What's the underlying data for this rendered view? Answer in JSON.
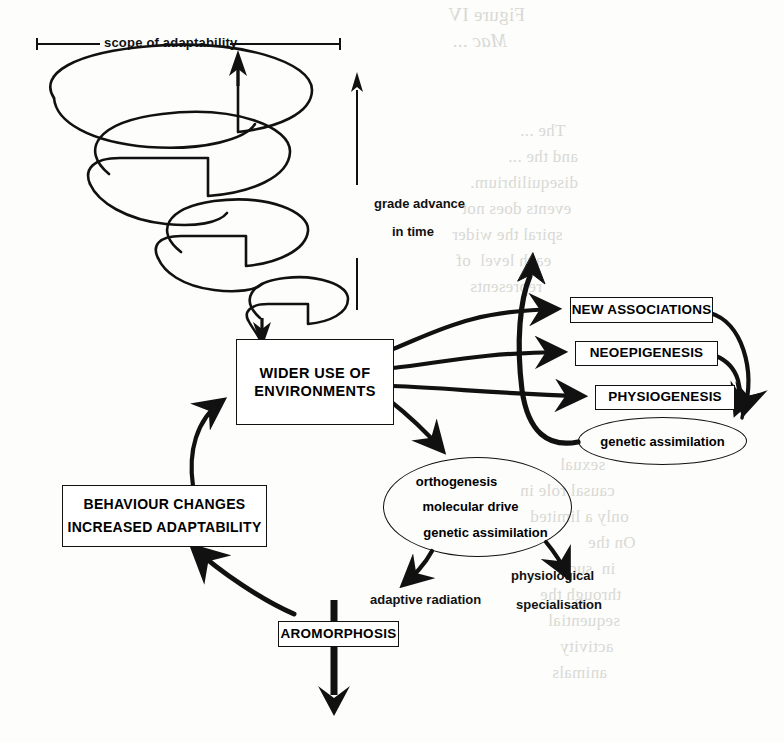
{
  "figure": {
    "title_caption": "",
    "scope_label": "scope of adaptability",
    "grade_label_line1": "grade advance",
    "grade_label_line2": "in  time"
  },
  "nodes": {
    "wider_use": {
      "line1": "WIDER USE OF",
      "line2": "ENVIRONMENTS"
    },
    "behaviour": {
      "line1": "BEHAVIOUR CHANGES",
      "line2": "INCREASED   ADAPTABILITY"
    },
    "aromorphosis": {
      "label": "AROMORPHOSIS"
    },
    "new_associations": {
      "label": "NEW ASSOCIATIONS"
    },
    "neoepigenesis": {
      "label": "NEOEPIGENESIS"
    },
    "physiogenesis": {
      "label": "PHYSIOGENESIS"
    },
    "genetic_assimilation_ellipse": {
      "label": "genetic assimilation"
    },
    "mechanisms_ellipse": {
      "line1": "orthogenesis",
      "line2": "molecular drive",
      "line3": "genetic assimilation"
    },
    "adaptive_radiation": {
      "label": "adaptive radiation"
    },
    "physiological_specialisation": {
      "line1": "physiological",
      "line2": "specialisation"
    }
  },
  "ghost_text": {
    "block1_line1": "Figure IV",
    "block1_line2": "Mac ...",
    "block2_line1": "The ...",
    "block2_line2": "and the ...",
    "block2_line3": "disequilibrium.",
    "block2_line4": "events does not",
    "block2_line5": "spiral the wider",
    "block2_line6": "each level  of",
    "block2_line7": "represents",
    "block3_line1": "sexual",
    "block3_line2": "causal role in",
    "block3_line3": "only a limited",
    "block3_line4": "On the",
    "block3_line5": "in  such",
    "block3_line6": "through the",
    "block3_line7": "sequential",
    "block3_line8": "activity",
    "block3_line9": "animals"
  },
  "colors": {
    "ink": "#111111",
    "paper": "#fdfdfc",
    "ghost": "#d9d9d4"
  }
}
